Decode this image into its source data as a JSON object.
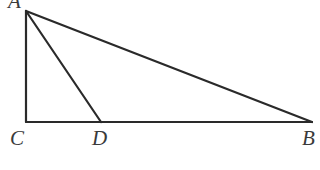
{
  "diagram": {
    "type": "right triangle with cevian",
    "points": {
      "A": {
        "label": "A",
        "x": 26,
        "y": 11
      },
      "B": {
        "label": "B",
        "x": 312,
        "y": 122
      },
      "C": {
        "label": "C",
        "x": 26,
        "y": 122
      },
      "D": {
        "label": "D",
        "x": 101,
        "y": 122
      }
    },
    "segments": [
      "AC",
      "CB",
      "AB",
      "AD"
    ],
    "right_angle_at": "C",
    "line_color": "#2a2a2a",
    "label_color": "#3a3a3a"
  }
}
